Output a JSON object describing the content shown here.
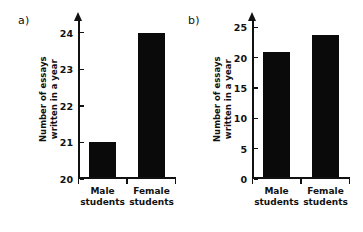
{
  "figure": {
    "background_color": "#ffffff",
    "ink_color": "#111111",
    "bar_color": "#0a0a0a"
  },
  "panels": [
    {
      "id": "a",
      "label": "a)",
      "ylabel_line1": "Number of essays",
      "ylabel_line2": "written in a year",
      "yticks": [
        20,
        21,
        22,
        23,
        24
      ],
      "ytick_labels": [
        "20",
        "21",
        "22",
        "23",
        "24"
      ],
      "ymin": 20,
      "ymax": 24.35,
      "categories": [
        {
          "line1": "Male",
          "line2": "students"
        },
        {
          "line1": "Female",
          "line2": "students"
        }
      ],
      "values": [
        21,
        24
      ]
    },
    {
      "id": "b",
      "label": "b)",
      "ylabel_line1": "Number of essays",
      "ylabel_line2": "written in a year",
      "yticks": [
        0,
        5,
        10,
        15,
        20,
        25
      ],
      "ytick_labels": [
        "0",
        "5",
        "10",
        "15",
        "20",
        "25"
      ],
      "ymin": 0,
      "ymax": 26.2,
      "categories": [
        {
          "line1": "Male",
          "line2": "students"
        },
        {
          "line1": "Female",
          "line2": "students"
        }
      ],
      "values": [
        21,
        23.8
      ]
    }
  ],
  "chart_data": [
    {
      "type": "bar",
      "title": "a)",
      "categories": [
        "Male students",
        "Female students"
      ],
      "values": [
        21,
        24
      ],
      "xlabel": "",
      "ylabel": "Number of essays written in a year",
      "ylim": [
        20,
        24.35
      ],
      "yticks": [
        20,
        21,
        22,
        23,
        24
      ],
      "grid": false,
      "legend": "none",
      "note": "Truncated y-axis starting at 20 exaggerates the difference"
    },
    {
      "type": "bar",
      "title": "b)",
      "categories": [
        "Male students",
        "Female students"
      ],
      "values": [
        21,
        23.8
      ],
      "xlabel": "",
      "ylabel": "Number of essays written in a year",
      "ylim": [
        0,
        26.2
      ],
      "yticks": [
        0,
        5,
        10,
        15,
        20,
        25
      ],
      "grid": false,
      "legend": "none",
      "note": "Full y-axis starting at 0 shows the true small difference"
    }
  ]
}
